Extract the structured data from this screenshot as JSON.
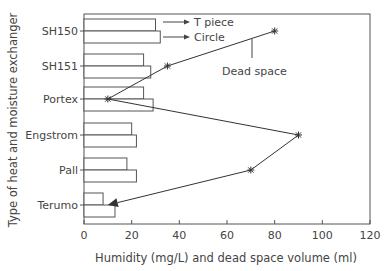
{
  "chart_data": {
    "type": "bar",
    "orientation": "horizontal",
    "title": "",
    "xlabel": "Humidity (mg/L) and dead space volume (ml)",
    "ylabel": "Type of heat and moisture exchanger",
    "xlim": [
      0,
      120
    ],
    "xticks": [
      0,
      20,
      40,
      60,
      80,
      100,
      120
    ],
    "grid": false,
    "categories": [
      "SH150",
      "SH151",
      "Portex",
      "Engstrom",
      "Pall",
      "Terumo"
    ],
    "series": [
      {
        "name": "T piece",
        "kind": "bar",
        "values": [
          30,
          25,
          25,
          20,
          18,
          8
        ]
      },
      {
        "name": "Circle",
        "kind": "bar",
        "values": [
          32,
          28,
          29,
          22,
          22,
          13
        ]
      },
      {
        "name": "Dead space",
        "kind": "line",
        "marker": "star",
        "values": [
          80,
          35,
          10,
          90,
          70,
          10
        ]
      }
    ],
    "annotations": [
      {
        "text": "T piece",
        "points_to": "top bar of SH150"
      },
      {
        "text": "Circle",
        "points_to": "bottom bar of SH150"
      },
      {
        "text": "Dead space",
        "points_to": "dead space line"
      }
    ],
    "legend_position": "inline annotations top-right"
  },
  "labels": {
    "t_piece": "T piece",
    "circle": "Circle",
    "dead_space": "Dead space",
    "xlabel": "Humidity (mg/L) and dead space volume (ml)",
    "ylabel": "Type of heat and moisture exchanger"
  },
  "colors": {
    "axis": "#555555",
    "bar_fill": "#ffffff",
    "bar_stroke": "#555555",
    "line": "#333333"
  }
}
